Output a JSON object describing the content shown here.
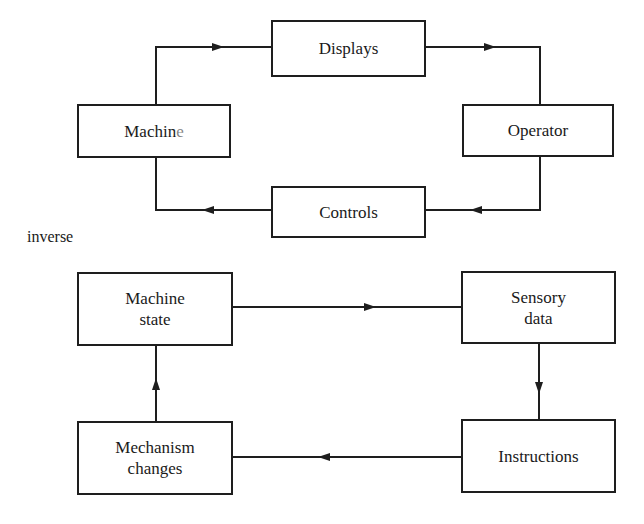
{
  "top_diagram": {
    "nodes": [
      {
        "id": "displays",
        "label": "Displays"
      },
      {
        "id": "machine",
        "label": "Machin",
        "label_tail": "e"
      },
      {
        "id": "operator",
        "label": "Operator"
      },
      {
        "id": "controls",
        "label": "Controls"
      }
    ],
    "edges": [
      {
        "from": "machine",
        "to": "displays"
      },
      {
        "from": "displays",
        "to": "operator"
      },
      {
        "from": "operator",
        "to": "controls"
      },
      {
        "from": "controls",
        "to": "machine"
      }
    ]
  },
  "caption": "inverse",
  "bottom_diagram": {
    "nodes": [
      {
        "id": "machine_state",
        "label": "Machine\nstate"
      },
      {
        "id": "sensory_data",
        "label": "Sensory\ndata"
      },
      {
        "id": "instructions",
        "label": "Instructions"
      },
      {
        "id": "mechanism_changes",
        "label": "Mechanism\nchanges"
      }
    ],
    "edges": [
      {
        "from": "machine_state",
        "to": "sensory_data"
      },
      {
        "from": "sensory_data",
        "to": "instructions"
      },
      {
        "from": "instructions",
        "to": "mechanism_changes"
      },
      {
        "from": "mechanism_changes",
        "to": "machine_state"
      }
    ]
  }
}
